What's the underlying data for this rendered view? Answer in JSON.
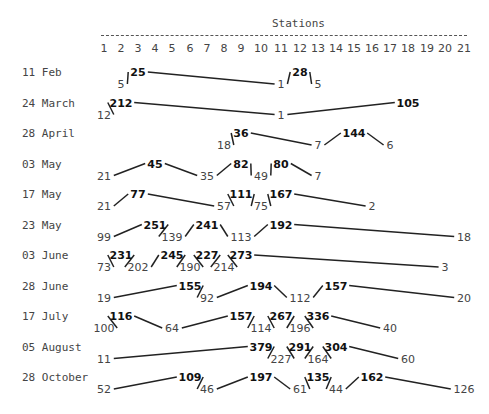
{
  "chart_data": {
    "type": "line",
    "title": "Stations",
    "xlabel": "Stations",
    "x": [
      1,
      2,
      3,
      4,
      5,
      6,
      7,
      8,
      9,
      10,
      11,
      12,
      13,
      14,
      15,
      16,
      17,
      18,
      19,
      20,
      21
    ],
    "rows": [
      {
        "label": "11 Feb",
        "points": [
          {
            "station": 2,
            "value": 5,
            "level": "lo"
          },
          {
            "station": 3,
            "value": 25,
            "level": "hi"
          },
          {
            "station": 11,
            "value": 1,
            "level": "lo"
          },
          {
            "station": 12,
            "value": 28,
            "level": "hi"
          },
          {
            "station": 13,
            "value": 5,
            "level": "lo"
          }
        ]
      },
      {
        "label": "24 March",
        "points": [
          {
            "station": 1,
            "value": 12,
            "level": "lo"
          },
          {
            "station": 2,
            "value": 212,
            "level": "hi"
          },
          {
            "station": 11,
            "value": 1,
            "level": "lo"
          },
          {
            "station": 18,
            "value": 105,
            "level": "hi"
          }
        ]
      },
      {
        "label": "28 April",
        "points": [
          {
            "station": 8,
            "value": 18,
            "level": "lo"
          },
          {
            "station": 9,
            "value": 36,
            "level": "hi"
          },
          {
            "station": 13,
            "value": 7,
            "level": "lo"
          },
          {
            "station": 15,
            "value": 144,
            "level": "hi"
          },
          {
            "station": 17,
            "value": 6,
            "level": "lo"
          }
        ]
      },
      {
        "label": "03 May",
        "points": [
          {
            "station": 1,
            "value": 21,
            "level": "lo"
          },
          {
            "station": 4,
            "value": 45,
            "level": "hi"
          },
          {
            "station": 7,
            "value": 35,
            "level": "lo"
          },
          {
            "station": 9,
            "value": 82,
            "level": "hi"
          },
          {
            "station": 10,
            "value": 49,
            "level": "lo"
          },
          {
            "station": 11,
            "value": 80,
            "level": "hi"
          },
          {
            "station": 13,
            "value": 7,
            "level": "lo"
          }
        ]
      },
      {
        "label": "17 May",
        "points": [
          {
            "station": 1,
            "value": 21,
            "level": "lo"
          },
          {
            "station": 3,
            "value": 77,
            "level": "hi"
          },
          {
            "station": 8,
            "value": 57,
            "level": "lo"
          },
          {
            "station": 9,
            "value": 111,
            "level": "hi"
          },
          {
            "station": 10,
            "value": 75,
            "level": "lo"
          },
          {
            "station": 11,
            "value": 167,
            "level": "hi"
          },
          {
            "station": 16,
            "value": 2,
            "level": "lo"
          }
        ]
      },
      {
        "label": "23 May",
        "points": [
          {
            "station": 1,
            "value": 99,
            "level": "lo"
          },
          {
            "station": 4,
            "value": 251,
            "level": "hi"
          },
          {
            "station": 5,
            "value": 139,
            "level": "lo"
          },
          {
            "station": 7,
            "value": 241,
            "level": "hi"
          },
          {
            "station": 9,
            "value": 113,
            "level": "lo"
          },
          {
            "station": 11,
            "value": 192,
            "level": "hi"
          },
          {
            "station": 21,
            "value": 18,
            "level": "lo"
          }
        ]
      },
      {
        "label": "03 June",
        "points": [
          {
            "station": 1,
            "value": 73,
            "level": "lo"
          },
          {
            "station": 2,
            "value": 231,
            "level": "hi"
          },
          {
            "station": 3,
            "value": 202,
            "level": "lo"
          },
          {
            "station": 5,
            "value": 245,
            "level": "hi"
          },
          {
            "station": 6,
            "value": 190,
            "level": "lo"
          },
          {
            "station": 7,
            "value": 227,
            "level": "hi"
          },
          {
            "station": 8,
            "value": 214,
            "level": "lo"
          },
          {
            "station": 9,
            "value": 273,
            "level": "hi"
          },
          {
            "station": 20,
            "value": 3,
            "level": "lo"
          }
        ]
      },
      {
        "label": "28 June",
        "points": [
          {
            "station": 1,
            "value": 19,
            "level": "lo"
          },
          {
            "station": 6,
            "value": 155,
            "level": "hi"
          },
          {
            "station": 7,
            "value": 92,
            "level": "lo"
          },
          {
            "station": 10,
            "value": 194,
            "level": "hi"
          },
          {
            "station": 12,
            "value": 112,
            "level": "lo"
          },
          {
            "station": 14,
            "value": 157,
            "level": "hi"
          },
          {
            "station": 21,
            "value": 20,
            "level": "lo"
          }
        ]
      },
      {
        "label": "17 July",
        "points": [
          {
            "station": 1,
            "value": 100,
            "level": "lo"
          },
          {
            "station": 2,
            "value": 116,
            "level": "hi"
          },
          {
            "station": 5,
            "value": 64,
            "level": "lo"
          },
          {
            "station": 9,
            "value": 157,
            "level": "hi"
          },
          {
            "station": 10,
            "value": 114,
            "level": "lo"
          },
          {
            "station": 11,
            "value": 267,
            "level": "hi"
          },
          {
            "station": 12,
            "value": 196,
            "level": "lo"
          },
          {
            "station": 13,
            "value": 336,
            "level": "hi"
          },
          {
            "station": 17,
            "value": 40,
            "level": "lo"
          }
        ]
      },
      {
        "label": "05 August",
        "points": [
          {
            "station": 1,
            "value": 11,
            "level": "lo"
          },
          {
            "station": 10,
            "value": 379,
            "level": "hi"
          },
          {
            "station": 11,
            "value": 227,
            "level": "lo"
          },
          {
            "station": 12,
            "value": 291,
            "level": "hi"
          },
          {
            "station": 13,
            "value": 164,
            "level": "lo"
          },
          {
            "station": 14,
            "value": 304,
            "level": "hi"
          },
          {
            "station": 18,
            "value": 60,
            "level": "lo"
          }
        ]
      },
      {
        "label": "28 October",
        "points": [
          {
            "station": 1,
            "value": 52,
            "level": "lo"
          },
          {
            "station": 6,
            "value": 109,
            "level": "hi"
          },
          {
            "station": 7,
            "value": 46,
            "level": "lo"
          },
          {
            "station": 10,
            "value": 197,
            "level": "hi"
          },
          {
            "station": 12,
            "value": 61,
            "level": "lo"
          },
          {
            "station": 13,
            "value": 135,
            "level": "hi"
          },
          {
            "station": 14,
            "value": 44,
            "level": "lo"
          },
          {
            "station": 16,
            "value": 162,
            "level": "hi"
          },
          {
            "station": 21,
            "value": 126,
            "level": "lo"
          }
        ]
      }
    ]
  }
}
